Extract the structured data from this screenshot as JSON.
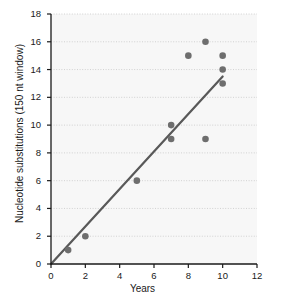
{
  "chart_data": {
    "type": "scatter",
    "title": "",
    "xlabel": "Years",
    "ylabel": "Nucleotide substitutions (150 nt window)",
    "xlim": [
      0,
      12
    ],
    "ylim": [
      0,
      18
    ],
    "xticks": [
      0,
      2,
      4,
      6,
      8,
      10,
      12
    ],
    "yticks": [
      0,
      2,
      4,
      6,
      8,
      10,
      12,
      14,
      16,
      18
    ],
    "grid": "horizontal-dotted",
    "legend": "none",
    "series": [
      {
        "name": "observations",
        "type": "scatter",
        "marker_color": "#6e6e6e",
        "marker_size": 5,
        "points": [
          {
            "x": 1,
            "y": 1
          },
          {
            "x": 2,
            "y": 2
          },
          {
            "x": 5,
            "y": 6
          },
          {
            "x": 7,
            "y": 10
          },
          {
            "x": 7,
            "y": 9
          },
          {
            "x": 8,
            "y": 15
          },
          {
            "x": 9,
            "y": 16
          },
          {
            "x": 9,
            "y": 9
          },
          {
            "x": 10,
            "y": 15
          },
          {
            "x": 10,
            "y": 14
          },
          {
            "x": 10,
            "y": 13
          }
        ]
      },
      {
        "name": "regression-line",
        "type": "line",
        "line_color": "#595959",
        "line_width": 2.2,
        "points": [
          {
            "x": 0,
            "y": 0
          },
          {
            "x": 10,
            "y": 13.5
          }
        ]
      }
    ]
  },
  "axes": {
    "x_title": "Years",
    "y_title": "Nucleotide substitutions (150 nt window)",
    "x_tick_labels": [
      "0",
      "2",
      "4",
      "6",
      "8",
      "10",
      "12"
    ],
    "y_tick_labels": [
      "0",
      "2",
      "4",
      "6",
      "8",
      "10",
      "12",
      "14",
      "16",
      "18"
    ]
  },
  "colors": {
    "marker": "#6e6e6e",
    "line": "#595959",
    "axis": "#1a1a1a",
    "grid": "#c8c8c8",
    "plot_background": "#f7f7f7",
    "page_background": "#ffffff"
  }
}
